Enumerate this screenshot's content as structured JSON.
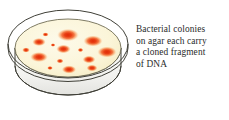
{
  "figure": {
    "background_color": "#ffffff"
  },
  "caption": {
    "lines": [
      "Bacterial colonies",
      "on agar each carry",
      "a cloned fragment",
      "of DNA"
    ],
    "full_text": "Bacterial colonies on agar each carry a cloned fragment of DNA",
    "text_color": "#2b2b2b"
  },
  "petri_dish": {
    "label": "petri-dish",
    "outline_color": "#3a3a33",
    "rim_fill": "#ffffff",
    "wall_fill": "#f1f1ee",
    "wall_shadow": "#dededa",
    "agar_fill": "#fbf6dc",
    "agar_edge": "#f3ecc6",
    "agar_outline": "#6d6a52",
    "view": "three-quarter isometric",
    "geometry": {
      "rim_cx": 64,
      "rim_cy": 40,
      "rim_rx": 60,
      "rim_ry": 34,
      "agar_cx": 64,
      "agar_cy": 44,
      "agar_rx": 53,
      "agar_ry": 29,
      "wall_depth": 26
    }
  },
  "colonies": {
    "color_center": "#e4300a",
    "color_mid": "#f4622a",
    "color_edge": "#fbf6dc",
    "count": 15,
    "items": [
      {
        "id": "colony-1",
        "cx": 64,
        "cy": 31,
        "rx": 9.0,
        "ry": 5.2,
        "size": "large"
      },
      {
        "id": "colony-2",
        "cx": 41.5,
        "cy": 30.5,
        "rx": 2.6,
        "ry": 1.8,
        "size": "small"
      },
      {
        "id": "colony-3",
        "cx": 35,
        "cy": 38,
        "rx": 5.6,
        "ry": 3.4,
        "size": "medium"
      },
      {
        "id": "colony-4",
        "cx": 89,
        "cy": 37,
        "rx": 8.0,
        "ry": 4.6,
        "size": "large"
      },
      {
        "id": "colony-5",
        "cx": 22,
        "cy": 46,
        "rx": 3.2,
        "ry": 2.2,
        "size": "small"
      },
      {
        "id": "colony-6",
        "cx": 59.5,
        "cy": 45,
        "rx": 6.0,
        "ry": 3.6,
        "size": "medium"
      },
      {
        "id": "colony-7",
        "cx": 76.5,
        "cy": 46,
        "rx": 2.4,
        "ry": 1.8,
        "size": "small"
      },
      {
        "id": "colony-8",
        "cx": 103,
        "cy": 48,
        "rx": 8.0,
        "ry": 4.6,
        "size": "large"
      },
      {
        "id": "colony-9",
        "cx": 35,
        "cy": 53,
        "rx": 7.4,
        "ry": 4.2,
        "size": "large"
      },
      {
        "id": "colony-10",
        "cx": 56,
        "cy": 57,
        "rx": 3.0,
        "ry": 2.0,
        "size": "small"
      },
      {
        "id": "colony-11",
        "cx": 85,
        "cy": 55.5,
        "rx": 5.4,
        "ry": 3.2,
        "size": "medium"
      },
      {
        "id": "colony-12",
        "cx": 46,
        "cy": 64,
        "rx": 2.4,
        "ry": 1.7,
        "size": "small"
      },
      {
        "id": "colony-13",
        "cx": 65,
        "cy": 65.5,
        "rx": 6.0,
        "ry": 3.4,
        "size": "medium"
      },
      {
        "id": "colony-14",
        "cx": 88,
        "cy": 64,
        "rx": 4.6,
        "ry": 2.8,
        "size": "medium"
      },
      {
        "id": "colony-15",
        "cx": 49,
        "cy": 41,
        "rx": 2.0,
        "ry": 1.5,
        "size": "small"
      }
    ]
  }
}
